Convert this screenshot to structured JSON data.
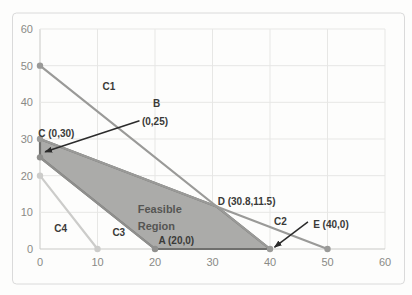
{
  "figure": {
    "background": "#fdfdfc",
    "border_color": "#dadada"
  },
  "chart_data": {
    "type": "line",
    "title": "",
    "xlabel": "",
    "ylabel": "",
    "xlim": [
      0,
      60
    ],
    "ylim": [
      0,
      60
    ],
    "xticks": [
      0,
      10,
      20,
      30,
      40,
      50,
      60
    ],
    "yticks": [
      0,
      10,
      20,
      30,
      40,
      50,
      60
    ],
    "grid": true,
    "grid_color": "#e7e7e5",
    "axis_color": "#c9c9c6",
    "tick_color": "#8a8a86",
    "tick_font_size": 11,
    "series": [
      {
        "name": "C1",
        "points": [
          [
            0,
            50
          ],
          [
            40,
            0
          ]
        ],
        "color": "#9a9a98"
      },
      {
        "name": "C2",
        "points": [
          [
            0,
            30
          ],
          [
            50,
            0
          ]
        ],
        "color": "#9a9a98"
      },
      {
        "name": "C3",
        "points": [
          [
            0,
            25
          ],
          [
            20,
            0
          ]
        ],
        "color": "#8f8f8d"
      },
      {
        "name": "C4",
        "points": [
          [
            0,
            20
          ],
          [
            10,
            0
          ]
        ],
        "color": "#ccccca"
      }
    ],
    "feasible_region": {
      "label": "Feasible Region",
      "vertices": [
        [
          0,
          30
        ],
        [
          30.8,
          11.5
        ],
        [
          40,
          0
        ],
        [
          20,
          0
        ],
        [
          0,
          25
        ]
      ],
      "fill": "#ababa9",
      "border": "#6f6f6d"
    },
    "key_points": [
      {
        "name": "A",
        "x": 20,
        "y": 0
      },
      {
        "name": "B",
        "x": 0,
        "y": 25
      },
      {
        "name": "C",
        "x": 0,
        "y": 30
      },
      {
        "name": "D",
        "x": 30.8,
        "y": 11.5
      },
      {
        "name": "E",
        "x": 40,
        "y": 0
      }
    ],
    "annotations": [
      {
        "text": "C1",
        "x": 12.0,
        "y": 44.3,
        "anchor": "middle"
      },
      {
        "text": "B",
        "x": 20.3,
        "y": 39.7,
        "anchor": "middle"
      },
      {
        "text": "(0,25)",
        "x": 20.0,
        "y": 34.8,
        "anchor": "middle"
      },
      {
        "text": "C (0,30)",
        "x": -0.3,
        "y": 31.6,
        "anchor": "start"
      },
      {
        "text": "D (30.8,11.5)",
        "x": 30.9,
        "y": 12.9,
        "anchor": "start"
      },
      {
        "text": "C2",
        "x": 41.8,
        "y": 7.4,
        "anchor": "middle"
      },
      {
        "text": "E (40,0)",
        "x": 50.6,
        "y": 6.6,
        "anchor": "middle"
      },
      {
        "text": "A (20,0)",
        "x": 23.7,
        "y": 2.2,
        "anchor": "middle"
      },
      {
        "text": "C3",
        "x": 13.7,
        "y": 4.6,
        "anchor": "middle"
      },
      {
        "text": "C4",
        "x": 3.6,
        "y": 5.7,
        "anchor": "middle"
      },
      {
        "text": "Feasible",
        "x": 17.0,
        "y": 10.8,
        "anchor": "start",
        "size": 11,
        "color": "#555553"
      },
      {
        "text": "Region",
        "x": 17.0,
        "y": 6.3,
        "anchor": "start",
        "size": 11,
        "color": "#555553"
      }
    ],
    "annotation_color": "#3a3a38",
    "annotation_font_size": 10,
    "arrows": [
      {
        "from": [
          17.3,
          35.0
        ],
        "to": [
          0.9,
          26.5
        ]
      },
      {
        "from": [
          46.6,
          7.4
        ],
        "to": [
          40.8,
          0.5
        ]
      }
    ],
    "arrow_color": "#2b2b2b"
  }
}
